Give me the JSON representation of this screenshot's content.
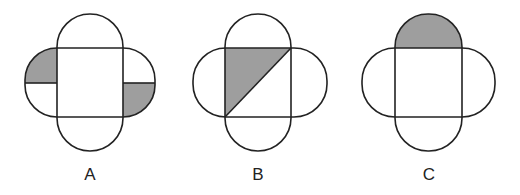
{
  "figure": {
    "type": "shaded-region-puzzle",
    "shape_description": "Two overlapping capsules (rounded rectangles) forming a cross",
    "colors": {
      "stroke": "#222222",
      "shade": "#9e9e9e",
      "background": "#ffffff"
    },
    "options": [
      {
        "label": "A",
        "shading": "upper half of left lobe and lower half of right lobe, split by horizontal midline"
      },
      {
        "label": "B",
        "shading": "upper-left triangle of center square, split by diagonal from bottom-left to top-right"
      },
      {
        "label": "C",
        "shading": "top lobe of vertical capsule"
      }
    ]
  }
}
